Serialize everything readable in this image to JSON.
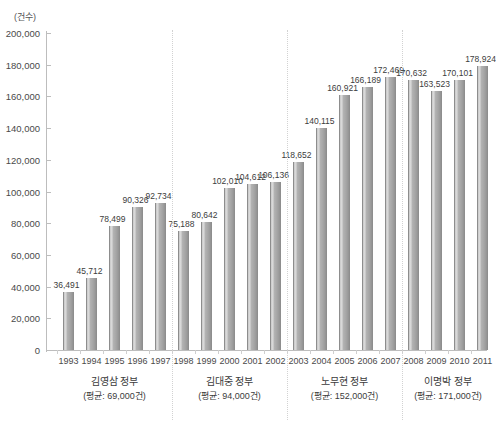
{
  "chart_data": {
    "type": "bar",
    "title": "",
    "subtitle": "",
    "xlabel": "",
    "ylabel": "(건수)",
    "unit_label": "(건수)",
    "ylim": [
      0,
      200000
    ],
    "ytick_step": 20000,
    "grid": false,
    "legend": null,
    "categories": [
      "1993",
      "1994",
      "1995",
      "1996",
      "1997",
      "1998",
      "1999",
      "2000",
      "2001",
      "2002",
      "2003",
      "2004",
      "2005",
      "2006",
      "2007",
      "2008",
      "2009",
      "2010",
      "2011"
    ],
    "values": [
      36491,
      45712,
      78499,
      90326,
      92734,
      75188,
      80642,
      102010,
      104612,
      106136,
      118652,
      140115,
      160921,
      166189,
      172469,
      170632,
      163523,
      170101,
      178924
    ],
    "value_labels": [
      "36,491",
      "45,712",
      "78,499",
      "90,326",
      "92,734",
      "75,188",
      "80,642",
      "102,010",
      "104,612",
      "106,136",
      "118,652",
      "140,115",
      "160,921",
      "166,189",
      "172,469",
      "170,632",
      "163,523",
      "170,101",
      "178,924"
    ],
    "ytick_labels": [
      "0",
      "20,000",
      "40,000",
      "60,000",
      "80,000",
      "100,000",
      "120,000",
      "140,000",
      "160,000",
      "180,000",
      "200,000"
    ],
    "ytick_values": [
      0,
      20000,
      40000,
      60000,
      80000,
      100000,
      120000,
      140000,
      160000,
      180000,
      200000
    ],
    "annotations": [
      {
        "name": "김영삼 정부",
        "average": "(평균: 69,000건)",
        "start": "1993",
        "end": "1997"
      },
      {
        "name": "김대중 정부",
        "average": "(평균: 94,000건)",
        "start": "1998",
        "end": "2002"
      },
      {
        "name": "노무현 정부",
        "average": "(평균: 152,000건)",
        "start": "2003",
        "end": "2007"
      },
      {
        "name": "이명박 정부",
        "average": "(평균: 171,000건)",
        "start": "2008",
        "end": "2011"
      }
    ],
    "colors": {
      "bar_fill": "#a6a6a6",
      "bar_edge": "#8d8d8d",
      "bar_highlight": "#dedede",
      "axis": "#bdbdbd",
      "separator": "#d2d2d2",
      "text": "#3c3c3c",
      "background": "#ffffff"
    }
  }
}
